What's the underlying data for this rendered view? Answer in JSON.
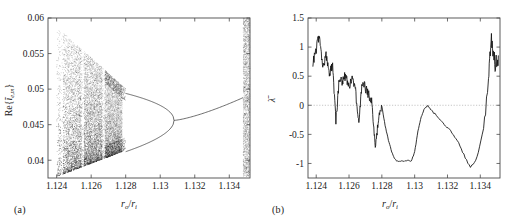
{
  "figure": {
    "panel_a_caption": "(a)",
    "panel_b_caption": "(b)"
  },
  "chart_data": [
    {
      "panel": "a",
      "type": "scatter",
      "title": "",
      "subtitle": "",
      "xlabel": "r_o/r_i",
      "ylabel": "Re{ĩ_e,m}",
      "xlabel_parts": {
        "base": "r",
        "sub1": "o",
        "divider": "/",
        "base2": "r",
        "sub2": "i"
      },
      "ylabel_parts": {
        "prefix": "Re{",
        "symbol": "ĩ",
        "sub": "e,m",
        "suffix": "}"
      },
      "xlim": [
        1.1235,
        1.1352
      ],
      "ylim": [
        0.0375,
        0.06
      ],
      "xticks": [
        1.124,
        1.126,
        1.128,
        1.13,
        1.132,
        1.134
      ],
      "xticklabels": [
        "1.124",
        "1.126",
        "1.128",
        "1.13",
        "1.132",
        "1.134"
      ],
      "yticks": [
        0.04,
        0.045,
        0.05,
        0.055,
        0.06
      ],
      "yticklabels": [
        "0.04",
        "0.045",
        "0.05",
        "0.055",
        "0.06"
      ],
      "grid": false,
      "legend": null,
      "description": "Bifurcation diagram: reverse period-doubling cascade. Wide chaotic band from x=1.1240 narrowing rightward, merging into period-4 near x=1.1272, period-2 near x=1.1280, single branch after x=1.1308, re-bifurcating near x=1.1345, plus a narrow full-range chaotic band at the right edge x>1.1348.",
      "chaos_band": {
        "x_start": 1.124,
        "x_end": 1.1278,
        "upper_envelope_start": 0.0588,
        "upper_envelope_end": 0.0505,
        "lower_envelope_start": 0.0377,
        "lower_envelope_end": 0.0412
      },
      "period2_branch": {
        "x_start": 1.128,
        "x_end": 1.1308,
        "upper_start": 0.0494,
        "upper_end": 0.0456,
        "lower_start": 0.0412,
        "lower_end": 0.0456
      },
      "period1_branch": {
        "x_start": 1.1308,
        "x_end": 1.1348,
        "y_start": 0.0456,
        "y_end": 0.0488
      },
      "right_chaos_band": {
        "x_start": 1.1348,
        "x_end": 1.1352,
        "y_min": 0.0377,
        "y_max": 0.06
      }
    },
    {
      "panel": "b",
      "type": "line",
      "title": "",
      "subtitle": "",
      "xlabel": "r_o/r_i",
      "ylabel": "λ̄",
      "xlabel_parts": {
        "base": "r",
        "sub1": "o",
        "divider": "/",
        "base2": "r",
        "sub2": "i"
      },
      "ylabel_parts": {
        "symbol": "λ",
        "overbar": true
      },
      "xlim": [
        1.1235,
        1.1352
      ],
      "ylim": [
        -1.25,
        1.5
      ],
      "xticks": [
        1.124,
        1.126,
        1.128,
        1.13,
        1.132,
        1.134
      ],
      "xticklabels": [
        "1.124",
        "1.126",
        "1.128",
        "1.13",
        "1.132",
        "1.134"
      ],
      "yticks": [
        -1,
        -0.5,
        0,
        0.5,
        1,
        1.5
      ],
      "yticklabels": [
        "-1",
        "-0.5",
        "0",
        "0.5",
        "1",
        "1.5"
      ],
      "grid": false,
      "zero_reference_line": 0,
      "legend": null,
      "description": "Mean Lyapunov exponent vs radius ratio. Noisy positive values near 1.124 peaking at 1.25, decaying with downward spikes to zero by 1.1278, then two deep negative wells reaching -0.97 and -1.08, touching zero at 1.1280 and 1.1307, followed by a sharp rise with oscillations up to 1.2 at the right edge.",
      "x": [
        1.1238,
        1.124,
        1.1242,
        1.1244,
        1.1246,
        1.1248,
        1.125,
        1.1252,
        1.1254,
        1.1256,
        1.1258,
        1.126,
        1.1262,
        1.1264,
        1.1266,
        1.1268,
        1.127,
        1.1272,
        1.1274,
        1.1276,
        1.1278,
        1.128,
        1.1282,
        1.1284,
        1.1286,
        1.1288,
        1.129,
        1.1292,
        1.1294,
        1.1296,
        1.1298,
        1.13,
        1.1302,
        1.1304,
        1.1306,
        1.1308,
        1.131,
        1.1314,
        1.1318,
        1.1322,
        1.1326,
        1.133,
        1.1334,
        1.1338,
        1.1342,
        1.1345,
        1.1347,
        1.1349,
        1.1351
      ],
      "y": [
        0.72,
        0.95,
        1.25,
        0.62,
        0.88,
        0.55,
        0.7,
        -0.27,
        0.45,
        0.42,
        0.52,
        0.3,
        0.48,
        0.24,
        -0.34,
        0.4,
        0.3,
        0.18,
        0.05,
        -0.72,
        -0.2,
        -0.02,
        -0.35,
        -0.6,
        -0.8,
        -0.93,
        -0.97,
        -0.95,
        -0.96,
        -0.94,
        -0.96,
        -0.8,
        -0.45,
        -0.2,
        -0.05,
        -0.01,
        -0.08,
        -0.2,
        -0.32,
        -0.45,
        -0.6,
        -0.85,
        -1.08,
        -0.9,
        -0.4,
        0.55,
        1.15,
        0.7,
        0.85
      ],
      "peak_max": 1.25,
      "peak_min": -1.08
    }
  ]
}
